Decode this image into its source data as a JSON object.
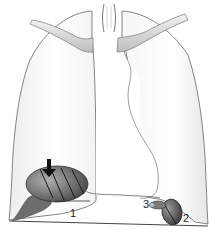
{
  "figure": {
    "type": "anatomical-illustration",
    "labels": [
      {
        "id": "1",
        "text": "1"
      },
      {
        "id": "2",
        "text": "2"
      },
      {
        "id": "3",
        "text": "3"
      }
    ],
    "arrow": {
      "direction": "down",
      "points_to": "hatched lesion at left lung base"
    },
    "colors": {
      "outline": "#555555",
      "lung_fill": "#f4f4f4",
      "lesion_dark": "#3a3a3a",
      "lesion_light": "#9a9a9a",
      "arrow": "#111111",
      "background": "#ffffff"
    }
  }
}
